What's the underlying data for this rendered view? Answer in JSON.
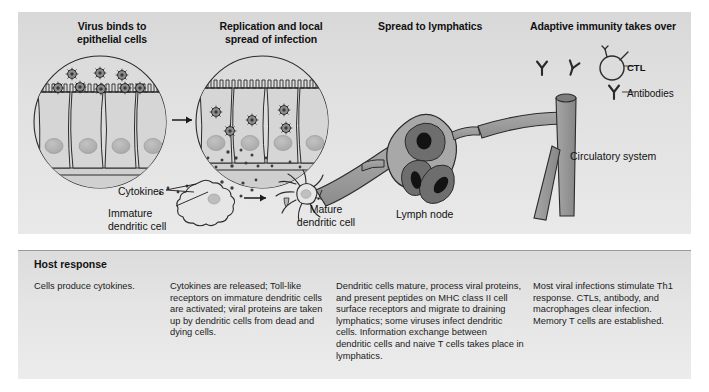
{
  "figure": {
    "stage_headers": [
      "Virus binds to\nepithelial cells",
      "Replication and local\nspread of infection",
      "Spread to lymphatics",
      "Adaptive immunity takes over"
    ],
    "header_lines": {
      "stage0_line1": "Virus binds to",
      "stage0_line2": "epithelial cells",
      "stage1_line1": "Replication and local",
      "stage1_line2": "spread of infection",
      "stage2_line1": "Spread to lymphatics",
      "stage3_line1": "Adaptive immunity takes over"
    },
    "labels": {
      "cytokines": "Cytokines",
      "immature_dendritic_line1": "Immature",
      "immature_dendritic_line2": "dendritic cell",
      "mature_dendritic_line1": "Mature",
      "mature_dendritic_line2": "dendritic cell",
      "lymph_node": "Lymph node",
      "circulatory_system": "Circulatory system",
      "ctl": "CTL",
      "antibodies": "Antibodies"
    },
    "host_response": {
      "title": "Host response",
      "columns": [
        "Cells produce cytokines.",
        "Cytokines are released; Toll-like receptors on immature dendritic cells are activated; viral proteins are taken up by dendritic cells from dead and dying cells.",
        "Dendritic cells mature, process viral proteins, and present peptides on MHC class II cell surface receptors and migrate to draining lymphatics; some viruses infect dendritic cells. Information exchange between dendritic cells and naive T cells takes place in lymphatics.",
        "Most viral infections stimulate Th1 response. CTLs, antibody, and macrophages clear infection. Memory T cells are established."
      ]
    },
    "colors": {
      "panel_light": "#e9e9e9",
      "panel_dark": "#d8d8d8",
      "cell_fill": "#d2d2d2",
      "nucleus": "#b4b4b4",
      "virus_fill": "#8a8a8a",
      "vessel_fill": "#9b9b9b",
      "lymph_lobe": "#6d6d6d",
      "lymph_nucleus": "#151515",
      "stroke": "#2a2a2a",
      "text": "#1b1b1b"
    },
    "counts": {
      "free_virions_stage0": 3,
      "bound_virions_stage0": 6,
      "internal_virions_stage1": 5,
      "epithelial_cells_per_circle": 4,
      "lymph_node_lobes": 3,
      "antibody_glyphs": 3
    }
  }
}
